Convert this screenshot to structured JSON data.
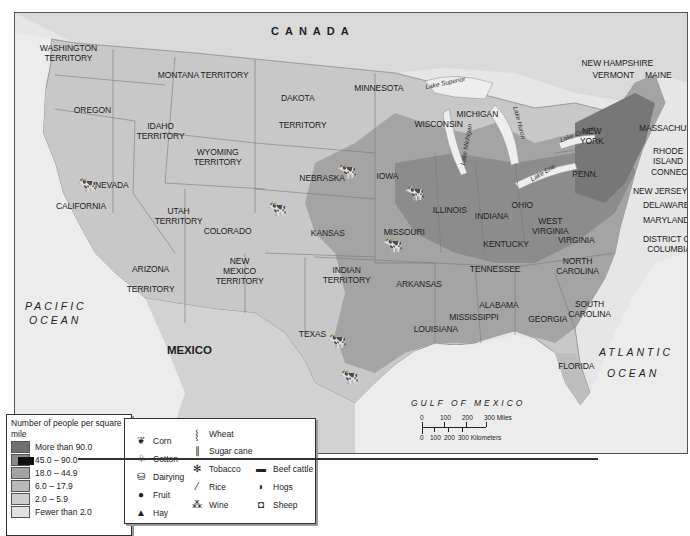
{
  "map": {
    "title_labels": {
      "canada": "CANADA",
      "mexico": "MEXICO",
      "pacific_1": "PACIFIC",
      "pacific_2": "OCEAN",
      "atlantic_1": "ATLANTIC",
      "atlantic_2": "OCEAN",
      "gulf": "GULF OF MEXICO"
    },
    "regions": [
      {
        "id": "washington",
        "label": "WASHINGTON\nTERRITORY",
        "x": 56,
        "y": 42
      },
      {
        "id": "oregon",
        "label": "OREGON",
        "x": 84,
        "y": 104
      },
      {
        "id": "idaho",
        "label": "IDAHO\nTERRITORY",
        "x": 150,
        "y": 120
      },
      {
        "id": "montana",
        "label": "MONTANA TERRITORY",
        "x": 184,
        "y": 69
      },
      {
        "id": "wyoming",
        "label": "WYOMING\nTERRITORY",
        "x": 207,
        "y": 146
      },
      {
        "id": "dakota",
        "label": "DAKOTA",
        "x": 290,
        "y": 92
      },
      {
        "id": "dakota2",
        "label": "TERRITORY",
        "x": 292,
        "y": 119
      },
      {
        "id": "minnesota",
        "label": "MINNESOTA",
        "x": 368,
        "y": 82
      },
      {
        "id": "wisconsin",
        "label": "WISCONSIN",
        "x": 428,
        "y": 118
      },
      {
        "id": "michigan",
        "label": "MICHIGAN",
        "x": 468,
        "y": 108
      },
      {
        "id": "nevada",
        "label": "NEVADA",
        "x": 104,
        "y": 179
      },
      {
        "id": "california",
        "label": "CALIFORNIA",
        "x": 70,
        "y": 200
      },
      {
        "id": "utah",
        "label": "UTAH\nTERRITORY",
        "x": 168,
        "y": 205
      },
      {
        "id": "colorado",
        "label": "COLORADO",
        "x": 217,
        "y": 225
      },
      {
        "id": "nebraska",
        "label": "NEBRASKA",
        "x": 312,
        "y": 172
      },
      {
        "id": "kansas",
        "label": "KANSAS",
        "x": 320,
        "y": 227
      },
      {
        "id": "iowa",
        "label": "IOWA",
        "x": 382,
        "y": 170
      },
      {
        "id": "illinois",
        "label": "ILLINOIS",
        "x": 442,
        "y": 204
      },
      {
        "id": "indiana",
        "label": "INDIANA",
        "x": 484,
        "y": 210
      },
      {
        "id": "ohio",
        "label": "OHIO",
        "x": 517,
        "y": 199
      },
      {
        "id": "missouri",
        "label": "MISSOURI",
        "x": 395,
        "y": 226
      },
      {
        "id": "kentucky",
        "label": "KENTUCKY",
        "x": 496,
        "y": 238
      },
      {
        "id": "west_virginia",
        "label": "WEST\nVIRGINIA",
        "x": 542,
        "y": 215
      },
      {
        "id": "virginia",
        "label": "VIRGINIA",
        "x": 568,
        "y": 234
      },
      {
        "id": "tennessee",
        "label": "TENNESSEE",
        "x": 484,
        "y": 263
      },
      {
        "id": "north_carolina",
        "label": "NORTH\nCAROLINA",
        "x": 568,
        "y": 255
      },
      {
        "id": "south_carolina",
        "label": "SOUTH\nCAROLINA",
        "x": 580,
        "y": 298
      },
      {
        "id": "arizona",
        "label": "ARIZONA\n\nTERRITORY",
        "x": 140,
        "y": 263
      },
      {
        "id": "new_mexico",
        "label": "NEW\nMEXICO\nTERRITORY",
        "x": 229,
        "y": 255
      },
      {
        "id": "indian",
        "label": "INDIAN\nTERRITORY",
        "x": 336,
        "y": 264
      },
      {
        "id": "arkansas",
        "label": "ARKANSAS",
        "x": 409,
        "y": 278
      },
      {
        "id": "texas",
        "label": "TEXAS",
        "x": 306,
        "y": 328
      },
      {
        "id": "louisiana",
        "label": "LOUISIANA",
        "x": 426,
        "y": 323
      },
      {
        "id": "mississippi",
        "label": "MISSISSIPPI",
        "x": 463,
        "y": 311
      },
      {
        "id": "alabama",
        "label": "ALABAMA",
        "x": 490,
        "y": 299
      },
      {
        "id": "georgia",
        "label": "GEORGIA",
        "x": 539,
        "y": 313
      },
      {
        "id": "florida",
        "label": "FLORIDA",
        "x": 568,
        "y": 360
      },
      {
        "id": "penn",
        "label": "PENN.",
        "x": 579,
        "y": 168
      },
      {
        "id": "new_york",
        "label": "NEW\nYORK",
        "x": 586,
        "y": 125
      },
      {
        "id": "vermont",
        "label": "VERMONT",
        "x": 604,
        "y": 69
      },
      {
        "id": "new_hampshire",
        "label": "NEW HAMPSHIRE",
        "x": 602,
        "y": 57
      },
      {
        "id": "maine",
        "label": "MAINE",
        "x": 652,
        "y": 69
      }
    ],
    "side_labels": [
      {
        "id": "massachusetts",
        "label": "MASSACHUSETTS",
        "x": 638,
        "y": 122
      },
      {
        "id": "rhode_island",
        "label": "RHODE\nISLAND",
        "x": 652,
        "y": 145
      },
      {
        "id": "connecticut",
        "label": "CONNECTICUT",
        "x": 650,
        "y": 166
      },
      {
        "id": "new_jersey",
        "label": "NEW JERSEY",
        "x": 632,
        "y": 185
      },
      {
        "id": "delaware",
        "label": "DELAWARE",
        "x": 642,
        "y": 199
      },
      {
        "id": "maryland",
        "label": "MARYLAND",
        "x": 642,
        "y": 214
      },
      {
        "id": "dc",
        "label": "DISTRICT OF\nCOLUMBIA",
        "x": 642,
        "y": 233
      }
    ],
    "lakes": [
      {
        "id": "superior",
        "label": "Lake Superior",
        "x": 424,
        "y": 78,
        "rot": -12
      },
      {
        "id": "michigan_lake",
        "label": "Lake Michigan",
        "x": 444,
        "y": 140,
        "rot": -80
      },
      {
        "id": "huron",
        "label": "Lake Huron",
        "x": 502,
        "y": 118,
        "rot": 75
      },
      {
        "id": "erie",
        "label": "Lake Erie",
        "x": 528,
        "y": 168,
        "rot": -30
      },
      {
        "id": "ontario",
        "label": "Lake Ontario",
        "x": 558,
        "y": 129,
        "rot": -20
      }
    ]
  },
  "population_legend": {
    "title": "Number of people per square mile",
    "items": [
      {
        "label": "More than 90.0",
        "color": "#6f6f6f"
      },
      {
        "label": "45.0 – 90.0",
        "color": "#8a8a8a"
      },
      {
        "label": "18.0 – 44.9",
        "color": "#a3a3a3"
      },
      {
        "label": "6.0 – 17.9",
        "color": "#b9b9b9"
      },
      {
        "label": "2.0 – 5.9",
        "color": "#cdcdcd"
      },
      {
        "label": "Fewer than 2.0",
        "color": "#e1e1e1"
      }
    ]
  },
  "product_legend": {
    "items": [
      {
        "icon": "corn-icon",
        "glyph": "❦",
        "label": "Corn"
      },
      {
        "icon": "cotton-icon",
        "glyph": "♧",
        "label": "Cotton"
      },
      {
        "icon": "dairying-icon",
        "glyph": "⛁",
        "label": "Dairying"
      },
      {
        "icon": "fruit-icon",
        "glyph": "●",
        "label": "Fruit"
      },
      {
        "icon": "hay-icon",
        "glyph": "▲",
        "label": "Hay"
      },
      {
        "icon": "wheat-icon",
        "glyph": "⸾",
        "label": "Wheat"
      },
      {
        "icon": "sugar-cane-icon",
        "glyph": "∥",
        "label": "Sugar cane"
      },
      {
        "icon": "tobacco-icon",
        "glyph": "✻",
        "label": "Tobacco"
      },
      {
        "icon": "rice-icon",
        "glyph": "⁄",
        "label": "Rice"
      },
      {
        "icon": "wine-icon",
        "glyph": "⁂",
        "label": "Wine"
      },
      {
        "icon": "beef-cattle-icon",
        "glyph": "▬",
        "label": "Beef cattle"
      },
      {
        "icon": "hogs-icon",
        "glyph": "◗",
        "label": "Hogs"
      },
      {
        "icon": "sheep-icon",
        "glyph": "◘",
        "label": "Sheep"
      }
    ]
  },
  "scale_bar": {
    "miles_ticks": [
      "0",
      "100",
      "200",
      "300 Miles"
    ],
    "km_ticks": [
      "0",
      "100",
      "200",
      "300 Kilometers"
    ]
  }
}
